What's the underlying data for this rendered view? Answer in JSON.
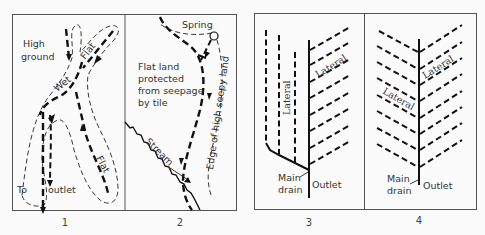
{
  "figure": {
    "panels": [
      {
        "number": "1",
        "labels": {
          "high_ground_line1": "High",
          "high_ground_line2": "ground",
          "flat_upper": "Flat",
          "wet": "Wet",
          "flat_lower": "Flat",
          "outlet_to": "To",
          "outlet_word": "outlet"
        }
      },
      {
        "number": "2",
        "labels": {
          "spring": "Spring",
          "protected_line1": "Flat land",
          "protected_line2": "protected",
          "protected_line3": "from seepage",
          "protected_line4": "by tile",
          "stream": "Stream",
          "edge": "Edge of high seepy land"
        }
      },
      {
        "number": "3",
        "labels": {
          "lateral_vertical": "Lateral",
          "lateral_diagonal": "Lateral",
          "main_line1": "Main",
          "main_line2": "drain",
          "outlet": "Outlet"
        }
      },
      {
        "number": "4",
        "labels": {
          "lateral_right": "Lateral",
          "lateral_left": "Lateral",
          "main_line1": "Main",
          "main_line2": "drain",
          "outlet": "Outlet"
        }
      }
    ]
  }
}
